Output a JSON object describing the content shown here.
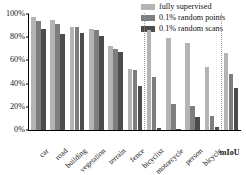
{
  "chart_data": {
    "type": "bar",
    "title": "",
    "xlabel": "",
    "ylabel": "",
    "ylim": [
      0,
      100
    ],
    "ytick_labels": [
      "0%",
      "20%",
      "40%",
      "60%",
      "80%",
      "100%"
    ],
    "ytick_values": [
      0,
      20,
      40,
      60,
      80,
      100
    ],
    "grid": false,
    "legend_position": "top-right",
    "categories": [
      "car",
      "road",
      "building",
      "vegetation",
      "terrain",
      "fence",
      "bicyclist",
      "motorcycle",
      "person",
      "bicycle",
      "mIoU"
    ],
    "series": [
      {
        "name": "fully supervised",
        "color": "#b4b4b4",
        "values": [
          97,
          95,
          89,
          87,
          72,
          53,
          86,
          79,
          75,
          54,
          66
        ]
      },
      {
        "name": "0.1% random points",
        "color": "#7e7e7e",
        "values": [
          94,
          91,
          89,
          86,
          70,
          52,
          46,
          22,
          21,
          12,
          48
        ]
      },
      {
        "name": "0.1% random scans",
        "color": "#4c4c4c",
        "values": [
          87,
          83,
          84,
          81,
          67,
          38,
          2,
          1,
          11,
          3,
          36
        ]
      }
    ],
    "separators_after": [
      "fence",
      "bicycle"
    ]
  },
  "legend": {
    "items": [
      {
        "label": "fully supervised",
        "color": "#b4b4b4"
      },
      {
        "label": "0.1% random points",
        "color": "#7e7e7e"
      },
      {
        "label": "0.1% random scans",
        "color": "#4c4c4c"
      }
    ]
  }
}
